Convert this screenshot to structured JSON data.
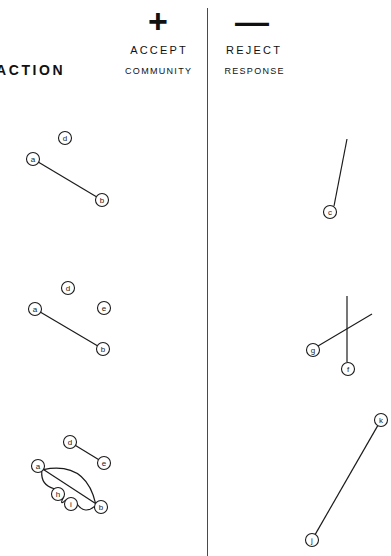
{
  "header": {
    "action_label": "ACTION",
    "plus_sign": "+",
    "minus_sign": "—",
    "accept_label": "ACCEPT",
    "reject_label": "REJECT",
    "community_label": "COMMUNITY",
    "response_label": "RESPONSE"
  },
  "colors": {
    "background": "#ffffff",
    "ink": "#1b1b1b",
    "divider": "#4a4a4a"
  },
  "diagram": {
    "node_radius": 6.5,
    "rows": [
      {
        "row_index": 1,
        "accept": {
          "nodes": [
            {
              "id": "d",
              "label": "d",
              "x": 65,
              "y": 138
            },
            {
              "id": "a",
              "label": "a",
              "x": 33,
              "y": 159
            },
            {
              "id": "b",
              "label": "b",
              "x": 102,
              "y": 200
            }
          ],
          "edges": [
            {
              "from": "a",
              "to": "b",
              "type": "line"
            }
          ]
        },
        "reject": {
          "nodes": [
            {
              "id": "c",
              "label": "c",
              "x": 330,
              "y": 212
            }
          ],
          "edges": [
            {
              "from": "c",
              "to": null,
              "type": "line",
              "x1": 334,
              "y1": 206,
              "x2": 347,
              "y2": 139
            }
          ]
        }
      },
      {
        "row_index": 2,
        "accept": {
          "nodes": [
            {
              "id": "d",
              "label": "d",
              "x": 68,
              "y": 288
            },
            {
              "id": "a",
              "label": "a",
              "x": 35,
              "y": 309
            },
            {
              "id": "e",
              "label": "e",
              "x": 104,
              "y": 308
            },
            {
              "id": "b",
              "label": "b",
              "x": 103,
              "y": 349
            }
          ],
          "edges": [
            {
              "from": "a",
              "to": "b",
              "type": "line"
            }
          ]
        },
        "reject": {
          "nodes": [
            {
              "id": "g",
              "label": "g",
              "x": 313,
              "y": 350
            },
            {
              "id": "f",
              "label": "f",
              "x": 348,
              "y": 369
            }
          ],
          "edges": [
            {
              "from": "g",
              "to": null,
              "type": "line",
              "x1": 318,
              "y1": 346,
              "x2": 372,
              "y2": 314
            },
            {
              "from": "f",
              "to": null,
              "type": "line",
              "x1": 347,
              "y1": 362,
              "x2": 347,
              "y2": 296
            }
          ]
        }
      },
      {
        "row_index": 3,
        "accept": {
          "nodes": [
            {
              "id": "d",
              "label": "d",
              "x": 70,
              "y": 442
            },
            {
              "id": "e",
              "label": "e",
              "x": 104,
              "y": 463
            },
            {
              "id": "a",
              "label": "a",
              "x": 38,
              "y": 466
            },
            {
              "id": "h",
              "label": "h",
              "x": 58,
              "y": 494
            },
            {
              "id": "i",
              "label": "i",
              "x": 71,
              "y": 504
            },
            {
              "id": "b",
              "label": "b",
              "x": 101,
              "y": 507
            }
          ],
          "edges": [
            {
              "from": "d",
              "to": "e",
              "type": "line"
            },
            {
              "from": "a",
              "to": "b",
              "type": "line"
            },
            {
              "from": "a",
              "to": "b",
              "type": "arc-upper"
            },
            {
              "from": "a",
              "to": "h",
              "type": "arc-lower"
            },
            {
              "from": "h",
              "to": "i",
              "type": "arc-lower"
            },
            {
              "from": "i",
              "to": "b",
              "type": "arc-lower"
            }
          ]
        },
        "reject": {
          "nodes": [
            {
              "id": "k",
              "label": "k",
              "x": 381,
              "y": 420
            },
            {
              "id": "j",
              "label": "j",
              "x": 312,
              "y": 540
            }
          ],
          "edges": [
            {
              "from": "k",
              "to": "j",
              "type": "line"
            }
          ]
        }
      }
    ]
  }
}
